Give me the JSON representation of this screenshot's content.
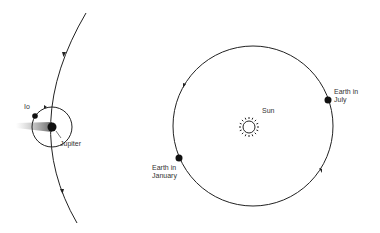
{
  "diagram": {
    "left_panel": {
      "labels": {
        "io": "Io",
        "jupiter": "Jupiter"
      },
      "elements": [
        "jupiter-orbit-path",
        "io-orbit-circle",
        "jupiter",
        "io",
        "jupiter-shadow"
      ]
    },
    "right_panel": {
      "labels": {
        "sun": "Sun",
        "earth_july_line1": "Earth in",
        "earth_july_line2": "July",
        "earth_january_line1": "Earth in",
        "earth_january_line2": "January"
      },
      "elements": [
        "earth-orbit-circle",
        "sun",
        "earth-july",
        "earth-january"
      ]
    },
    "colors": {
      "line": "#222222",
      "body": "#111111",
      "text": "#333333"
    }
  }
}
